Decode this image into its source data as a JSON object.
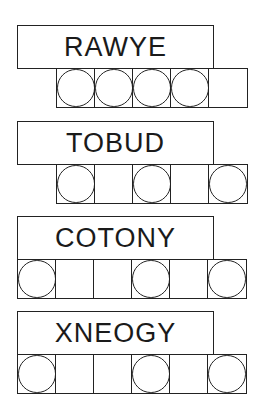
{
  "puzzles": [
    {
      "scrambled_word": "RAWYE",
      "cell_count": 5,
      "start_offset": 1,
      "circled_cells": [
        true,
        true,
        true,
        true,
        false
      ]
    },
    {
      "scrambled_word": "TOBUD",
      "cell_count": 5,
      "start_offset": 1,
      "circled_cells": [
        true,
        false,
        true,
        false,
        true
      ]
    },
    {
      "scrambled_word": "COTONY",
      "cell_count": 6,
      "start_offset": 0,
      "circled_cells": [
        true,
        false,
        false,
        true,
        false,
        true
      ]
    },
    {
      "scrambled_word": "XNEOGY",
      "cell_count": 6,
      "start_offset": 0,
      "circled_cells": [
        true,
        false,
        false,
        true,
        false,
        true
      ]
    }
  ],
  "colors": {
    "line": "#222222",
    "text": "#1a1a1a",
    "background": "#ffffff"
  }
}
